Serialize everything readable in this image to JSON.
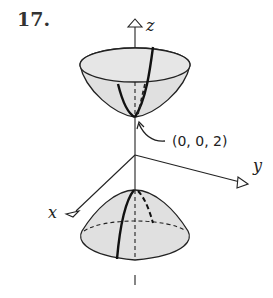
{
  "problem": {
    "number": "17."
  },
  "axes": {
    "x": "x",
    "y": "y",
    "z": "z"
  },
  "annotation": {
    "point_label": "(0, 0, 2)"
  },
  "colors": {
    "surface_fill": "#e0e0e0",
    "stroke": "#222222",
    "background": "#ffffff"
  },
  "surfaces": [
    {
      "name": "upper-sheet",
      "shape": "paraboloid opening upward",
      "vertex": "(0, 0, 2)"
    },
    {
      "name": "lower-sheet",
      "shape": "paraboloid opening downward"
    }
  ]
}
